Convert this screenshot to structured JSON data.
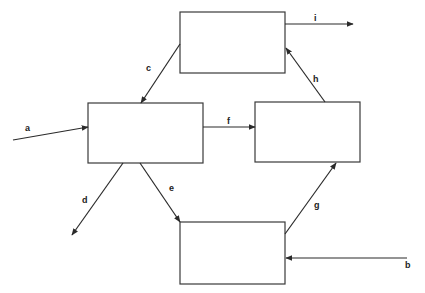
{
  "diagram": {
    "type": "flow-block-diagram",
    "nodes": [
      {
        "id": "top",
        "label": "",
        "x": 180,
        "y": 12,
        "w": 105,
        "h": 61
      },
      {
        "id": "left",
        "label": "",
        "x": 88,
        "y": 103,
        "w": 115,
        "h": 60
      },
      {
        "id": "right",
        "label": "",
        "x": 255,
        "y": 102,
        "w": 105,
        "h": 60
      },
      {
        "id": "bottom",
        "label": "",
        "x": 180,
        "y": 222,
        "w": 105,
        "h": 62
      }
    ],
    "edges": [
      {
        "label": "a",
        "from": "external",
        "to": "left"
      },
      {
        "label": "b",
        "from": "external",
        "to": "bottom"
      },
      {
        "label": "c",
        "from": "top",
        "to": "left"
      },
      {
        "label": "d",
        "from": "left",
        "to": "external"
      },
      {
        "label": "e",
        "from": "left",
        "to": "bottom"
      },
      {
        "label": "f",
        "from": "left",
        "to": "right"
      },
      {
        "label": "g",
        "from": "bottom",
        "to": "right"
      },
      {
        "label": "h",
        "from": "right",
        "to": "top"
      },
      {
        "label": "i",
        "from": "top",
        "to": "external"
      }
    ]
  },
  "labels": {
    "a": "a",
    "b": "b",
    "c": "c",
    "d": "d",
    "e": "e",
    "f": "f",
    "g": "g",
    "h": "h",
    "i": "i"
  },
  "colors": {
    "line": "#2a2a2a",
    "box_stroke": "#3a3a3a",
    "background": "#ffffff"
  }
}
